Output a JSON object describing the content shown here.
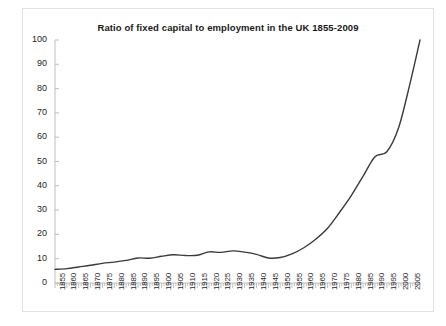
{
  "chart_data": {
    "type": "line",
    "title": "Ratio of fixed capital to employment in the UK 1855-2009",
    "xlabel": "",
    "ylabel": "",
    "xlim": [
      1855,
      2009
    ],
    "ylim": [
      0,
      100
    ],
    "grid": false,
    "legend": null,
    "line_color": "#3a3a3a",
    "yticks": [
      0,
      10,
      20,
      30,
      40,
      50,
      60,
      70,
      80,
      90,
      100
    ],
    "xticks": [
      1855,
      1860,
      1865,
      1870,
      1875,
      1880,
      1885,
      1890,
      1895,
      1900,
      1905,
      1910,
      1915,
      1920,
      1925,
      1930,
      1935,
      1940,
      1945,
      1950,
      1955,
      1960,
      1965,
      1970,
      1975,
      1980,
      1985,
      1990,
      1995,
      2000,
      2005
    ],
    "x": [
      1855,
      1860,
      1865,
      1870,
      1875,
      1880,
      1885,
      1890,
      1895,
      1900,
      1905,
      1910,
      1915,
      1920,
      1925,
      1930,
      1935,
      1940,
      1945,
      1950,
      1955,
      1960,
      1965,
      1970,
      1975,
      1980,
      1985,
      1990,
      1995,
      2000,
      2005,
      2009
    ],
    "values": [
      5.6,
      5.9,
      6.6,
      7.3,
      8.1,
      8.6,
      9.3,
      10.3,
      10.2,
      11.0,
      11.6,
      11.3,
      11.4,
      12.8,
      12.6,
      13.2,
      12.7,
      11.8,
      10.3,
      10.5,
      12.0,
      14.5,
      18.0,
      22.5,
      29.0,
      36.0,
      44.0,
      52.0,
      54.0,
      64.0,
      83.0,
      100.0
    ]
  }
}
